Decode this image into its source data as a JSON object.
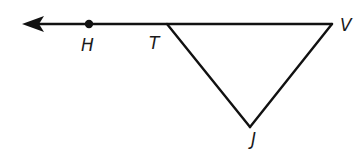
{
  "diagram": {
    "type": "geometry",
    "points": {
      "H": {
        "label": "H",
        "marked_with_dot": true
      },
      "T": {
        "label": "T",
        "marked_with_dot": false
      },
      "V": {
        "label": "V",
        "marked_with_dot": false
      },
      "J": {
        "label": "J",
        "marked_with_dot": false
      }
    },
    "segments": [
      {
        "from": "T",
        "to": "V"
      },
      {
        "from": "T",
        "to": "J"
      },
      {
        "from": "V",
        "to": "J"
      }
    ],
    "rays": [
      {
        "from": "V",
        "through": "H",
        "direction": "left",
        "arrowhead": true
      }
    ],
    "colors": {
      "stroke": "#111111",
      "label": "#1a1a1a",
      "background": "#ffffff"
    }
  }
}
